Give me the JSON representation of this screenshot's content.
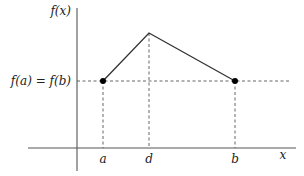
{
  "diagram": {
    "type": "function-plot",
    "labels": {
      "y_axis": "f(x)",
      "x_axis": "x",
      "level": "f(a) = f(b)",
      "a": "a",
      "d": "d",
      "b": "b"
    },
    "colors": {
      "axis": "#555555",
      "curve": "#333333",
      "point": "#000000",
      "text": "#222222"
    },
    "points": [
      {
        "name": "a",
        "x": 103,
        "y": 81
      },
      {
        "name": "d",
        "x": 149,
        "y": 33
      },
      {
        "name": "b",
        "x": 235,
        "y": 81
      }
    ]
  }
}
